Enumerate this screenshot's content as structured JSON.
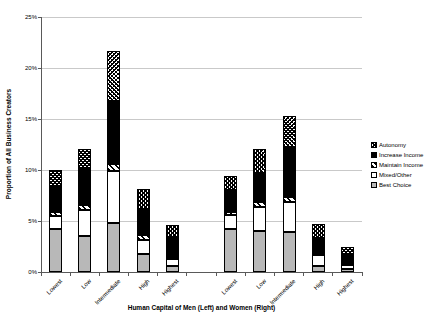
{
  "figure": {
    "background": "#ffffff"
  },
  "chart_data": {
    "type": "bar",
    "stacked": true,
    "title": "",
    "ylabel": "Proportion of All Business Creators",
    "xlabel": "Human Capital of Men (Left) and Women (Right)",
    "ylim": [
      0,
      25
    ],
    "ytick_values": [
      0,
      5,
      10,
      15,
      20,
      25
    ],
    "ytick_labels": [
      "0%",
      "5%",
      "10%",
      "15%",
      "20%",
      "25%"
    ],
    "grid": "horizontal",
    "legend_position": "right",
    "groups": [
      {
        "name": "Men",
        "side": "Left",
        "categories": [
          "Lowest",
          "Low",
          "Intermediate",
          "High",
          "Highest"
        ]
      },
      {
        "name": "Women",
        "side": "Right",
        "categories": [
          "Lowest",
          "Low",
          "Intermediate",
          "High",
          "Highest"
        ]
      }
    ],
    "stack_order_note": "series listed bottom to top of each bar; values are percent of all business creators",
    "series": [
      {
        "name": "Best Choice",
        "pattern": "solid-gray",
        "values": {
          "men": [
            4.2,
            3.5,
            4.8,
            1.8,
            0.6
          ],
          "women": [
            4.2,
            4.0,
            3.9,
            0.6,
            0.3
          ]
        }
      },
      {
        "name": "Mixed/Other",
        "pattern": "white",
        "values": {
          "men": [
            1.3,
            2.6,
            5.1,
            1.3,
            0.7
          ],
          "women": [
            1.4,
            2.4,
            3.0,
            1.1,
            0.4
          ]
        }
      },
      {
        "name": "Maintain Income",
        "pattern": "diagonal",
        "values": {
          "men": [
            0.4,
            0.5,
            0.7,
            0.5,
            0.0
          ],
          "women": [
            0.3,
            0.5,
            0.5,
            0.1,
            0.0
          ]
        }
      },
      {
        "name": "Increase Income",
        "pattern": "solid-black",
        "values": {
          "men": [
            2.4,
            3.6,
            6.2,
            2.6,
            2.1
          ],
          "women": [
            2.1,
            2.8,
            4.9,
            1.5,
            1.1
          ]
        }
      },
      {
        "name": "Autonomy",
        "pattern": "crosshatch",
        "values": {
          "men": [
            1.7,
            1.9,
            4.9,
            1.9,
            1.2
          ],
          "women": [
            1.4,
            2.4,
            3.0,
            1.4,
            0.7
          ]
        }
      }
    ],
    "bar_totals": {
      "men": [
        10.0,
        12.1,
        21.7,
        8.1,
        4.6
      ],
      "women": [
        9.4,
        12.1,
        15.3,
        4.7,
        2.5
      ]
    },
    "legend_order": [
      "Autonomy",
      "Increase Income",
      "Maintain Income",
      "Mixed/Other",
      "Best Choice"
    ]
  },
  "colors": {
    "bar_gray": "#b8b8b8",
    "black": "#000000",
    "white": "#ffffff",
    "gridline": "#c9c9c9",
    "axis": "#595959",
    "text": "#000000"
  }
}
